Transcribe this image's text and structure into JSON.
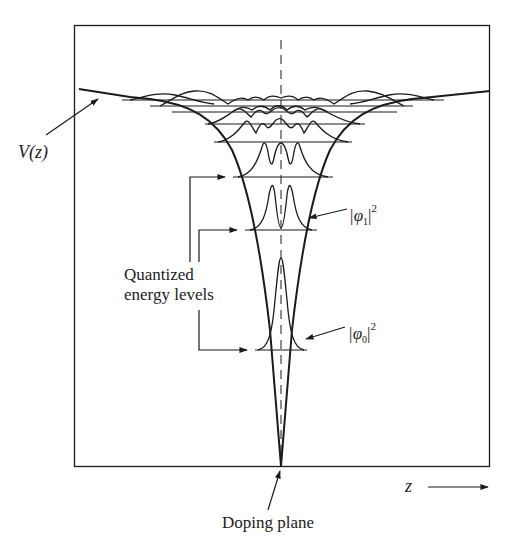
{
  "diagram": {
    "labels": {
      "potential": "V(z)",
      "quantized_levels_line1": "Quantized",
      "quantized_levels_line2": "energy levels",
      "phi1": "|φ₁|²",
      "phi1_base": "|φ",
      "phi1_sub": "1",
      "phi1_end": "|",
      "phi1_sup": "2",
      "phi0_base": "|φ",
      "phi0_sub": "0",
      "phi0_end": "|",
      "phi0_sup": "2",
      "z_axis": "z",
      "doping_plane": "Doping plane"
    },
    "colors": {
      "line": "#1a1a1a",
      "background": "#ffffff"
    },
    "frame": {
      "x": 74,
      "y": 25,
      "width": 416,
      "height": 442
    },
    "center_x": 281,
    "energy_levels_y": [
      350,
      230,
      177,
      123,
      108,
      98,
      93
    ]
  }
}
